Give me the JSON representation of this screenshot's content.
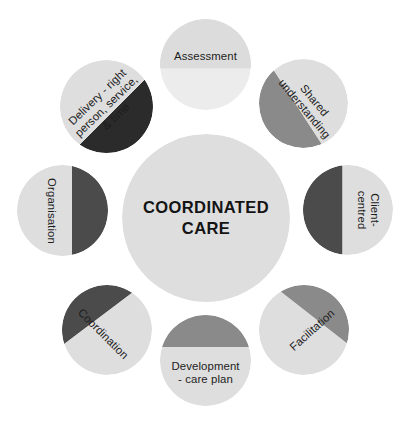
{
  "diagram": {
    "title": "Coordinated Care",
    "type": "radial-hub-and-spoke",
    "center": {
      "id": "center",
      "label": "COORDINATED\nCARE",
      "fill": "#dedede",
      "text_color": "#141414",
      "wedge": null
    },
    "colors": {
      "light_gray": "#dedede",
      "pale_gray": "#ececec",
      "medium_gray": "#8a8a8a",
      "dark_gray": "#4b4b4b",
      "near_black": "#2b2b2b",
      "background": "#ffffff",
      "text": "#1d1d1d"
    },
    "nodes": [
      {
        "id": "assessment",
        "label": "Assessment",
        "position": "top",
        "rotation": 0,
        "base_fill": "#ececec",
        "wedge_fill": "#dcdcdc",
        "wedge_angle": 0,
        "wedge_fraction": 0.55
      },
      {
        "id": "shared-understanding",
        "label": "Shared\nunderstanding",
        "position": "top-right",
        "rotation": 50,
        "base_fill": "#dedede",
        "wedge_fill": "#8a8a8a",
        "wedge_angle": 230,
        "wedge_fraction": 0.42
      },
      {
        "id": "client-centred",
        "label": "Client-\ncentred",
        "position": "right",
        "rotation": 90,
        "base_fill": "#dedede",
        "wedge_fill": "#4b4b4b",
        "wedge_angle": 270,
        "wedge_fraction": 0.45
      },
      {
        "id": "facilitation",
        "label": "Facilitation",
        "position": "bottom-right",
        "rotation": -42,
        "base_fill": "#dedede",
        "wedge_fill": "#8a8a8a",
        "wedge_angle": 315,
        "wedge_fraction": 0.33
      },
      {
        "id": "development-care-plan",
        "label": "Development\n- care plan",
        "position": "bottom",
        "rotation": 0,
        "base_fill": "#dedede",
        "wedge_fill": "#8a8a8a",
        "wedge_angle": 0,
        "wedge_fraction": 0.38
      },
      {
        "id": "coordination",
        "label": "Coordination",
        "position": "bottom-left",
        "rotation": 45,
        "base_fill": "#dedede",
        "wedge_fill": "#4b4b4b",
        "wedge_angle": 45,
        "wedge_fraction": 0.38
      },
      {
        "id": "organisation",
        "label": "Organisation",
        "position": "left",
        "rotation": 90,
        "base_fill": "#dedede",
        "wedge_fill": "#4b4b4b",
        "wedge_angle": 90,
        "wedge_fraction": 0.42
      },
      {
        "id": "delivery",
        "label": "Delivery - right\nperson, service,\n& time",
        "position": "top-left",
        "rotation": -44,
        "base_fill": "#dedede",
        "wedge_fill": "#2b2b2b",
        "wedge_angle": 135,
        "wedge_fraction": 0.4
      }
    ]
  }
}
